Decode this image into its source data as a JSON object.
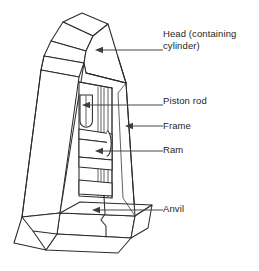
{
  "figure": {
    "background_color": "#ffffff",
    "line_color": "#2b2b2b",
    "text_color": "#231f20"
  },
  "callouts": [
    {
      "id": "head",
      "label": "Head (containing\ncylinder)",
      "line1": "Head (containing",
      "line2": "cylinder)",
      "arrow_direction": "left",
      "target": "head of press"
    },
    {
      "id": "piston-rod",
      "label": "Piston rod",
      "arrow_direction": "left",
      "target": "piston rod inside cavity"
    },
    {
      "id": "frame",
      "label": "Frame",
      "arrow_direction": "left",
      "target": "right outer edge of frame"
    },
    {
      "id": "ram",
      "label": "Ram",
      "arrow_direction": "left",
      "target": "ram block"
    },
    {
      "id": "anvil",
      "label": "Anvil",
      "arrow_direction": "left",
      "target": "anvil at base"
    }
  ]
}
